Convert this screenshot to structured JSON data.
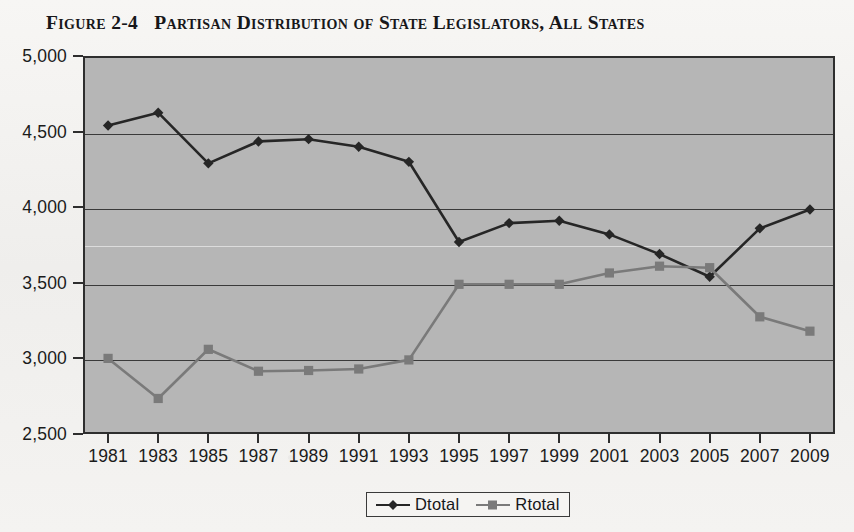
{
  "figure": {
    "label": "Figure 2-4",
    "title": "Partisan Distribution of State Legislators, All States"
  },
  "colors": {
    "page_background": "#f3f2f0",
    "plot_background": "#b6b6b6",
    "axis": "#2e2e2e",
    "gridline": "#3a3a3a",
    "gridline_light": "#dcdcdc",
    "dtotal": "#262626",
    "rtotal": "#7a7a7a",
    "text": "#1b1b1b"
  },
  "chart_data": {
    "type": "line",
    "title": "Partisan Distribution of State Legislators, All States",
    "xlabel": "",
    "ylabel": "",
    "categories": [
      "1981",
      "1983",
      "1985",
      "1987",
      "1989",
      "1991",
      "1993",
      "1995",
      "1997",
      "1999",
      "2001",
      "2003",
      "2005",
      "2007",
      "2009"
    ],
    "ylim": [
      2500,
      5000
    ],
    "yticks": [
      2500,
      3000,
      3500,
      4000,
      4500,
      5000
    ],
    "ytick_labels": [
      "2,500",
      "3,000",
      "3,500",
      "4,000",
      "4,500",
      "5,000"
    ],
    "grid": true,
    "legend_position": "bottom",
    "series": [
      {
        "name": "Dtotal",
        "marker": "diamond",
        "color": "#262626",
        "values": [
          4540,
          4625,
          4290,
          4435,
          4450,
          4400,
          4300,
          3770,
          3895,
          3910,
          3820,
          3690,
          3540,
          3860,
          3985
        ]
      },
      {
        "name": "Rtotal",
        "marker": "square",
        "color": "#7a7a7a",
        "values": [
          3000,
          2735,
          3060,
          2915,
          2920,
          2930,
          2990,
          3490,
          3490,
          3490,
          3565,
          3610,
          3600,
          3275,
          3180
        ]
      }
    ]
  },
  "legend": {
    "entries": [
      {
        "label": "Dtotal"
      },
      {
        "label": "Rtotal"
      }
    ]
  }
}
